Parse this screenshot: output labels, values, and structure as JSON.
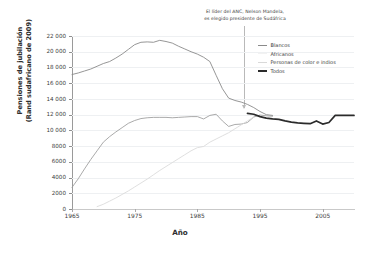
{
  "chart_data": {
    "type": "line",
    "title": "",
    "annotation": {
      "line1": "El líder del ANC, Nelson Mandela,",
      "line2": "es elegido presidente de Sudáfrica",
      "year": 1994
    },
    "xlabel": "Año",
    "ylabel_line1": "Pensiones de jubilación",
    "ylabel_line2": "(Rand sudafricano de 2009)",
    "xlim": [
      1965,
      2010
    ],
    "ylim": [
      0,
      22000
    ],
    "grid": true,
    "legend_position": "top-right",
    "xticks": [
      1965,
      1975,
      1985,
      1995,
      2005
    ],
    "xtick_labels": [
      "1965",
      "1975",
      "1985",
      "1995",
      "2005"
    ],
    "yticks": [
      0,
      2000,
      4000,
      6000,
      8000,
      10000,
      12000,
      14000,
      16000,
      18000,
      20000,
      22000
    ],
    "ytick_labels": [
      "0",
      "2000",
      "4000",
      "6000",
      "8000",
      "10 000",
      "12 000",
      "14 000",
      "16 000",
      "18 000",
      "20 000",
      "22 000"
    ],
    "series": [
      {
        "name": "Blancos",
        "color": "#8a8a8a",
        "width": 0.9,
        "x": [
          1965,
          1966,
          1967,
          1968,
          1969,
          1970,
          1971,
          1972,
          1973,
          1974,
          1975,
          1976,
          1977,
          1978,
          1979,
          1980,
          1981,
          1982,
          1983,
          1984,
          1985,
          1986,
          1987,
          1988,
          1989,
          1990,
          1991,
          1992,
          1993,
          1994,
          1995,
          1996,
          1997
        ],
        "values": [
          17100,
          17300,
          17550,
          17800,
          18150,
          18500,
          18750,
          19200,
          19700,
          20300,
          20900,
          21200,
          21250,
          21200,
          21450,
          21300,
          21100,
          20700,
          20350,
          20000,
          19700,
          19300,
          18750,
          17000,
          15300,
          14100,
          13800,
          13600,
          13300,
          12900,
          12400,
          12000,
          11900
        ]
      },
      {
        "name": "Africanos",
        "color": "#9b9b9b",
        "width": 0.85,
        "x": [
          1965,
          1966,
          1967,
          1968,
          1969,
          1970,
          1971,
          1972,
          1973,
          1974,
          1975,
          1976,
          1977,
          1978,
          1979,
          1980,
          1981,
          1982,
          1983,
          1984,
          1985,
          1986,
          1987,
          1988,
          1989,
          1990,
          1991,
          1992,
          1993,
          1994,
          1995,
          1996,
          1997
        ],
        "values": [
          2750,
          3850,
          5100,
          6300,
          7400,
          8500,
          9200,
          9800,
          10350,
          10900,
          11250,
          11500,
          11600,
          11650,
          11650,
          11650,
          11600,
          11650,
          11700,
          11750,
          11750,
          11450,
          11900,
          12050,
          11200,
          10500,
          10750,
          10800,
          11000,
          11700,
          11950,
          11850,
          11800
        ]
      },
      {
        "name": "Personas de color e indios",
        "color": "#d9d9d9",
        "width": 0.85,
        "x": [
          1969,
          1970,
          1971,
          1972,
          1973,
          1974,
          1975,
          1976,
          1977,
          1978,
          1979,
          1980,
          1981,
          1982,
          1983,
          1984,
          1985,
          1986,
          1987,
          1988,
          1989,
          1990,
          1991,
          1992,
          1993,
          1994
        ],
        "values": [
          300,
          600,
          1000,
          1400,
          1850,
          2300,
          2800,
          3300,
          3800,
          4350,
          4900,
          5400,
          5900,
          6400,
          6900,
          7400,
          7800,
          7950,
          8500,
          8900,
          9300,
          9700,
          10200,
          10700,
          11200,
          11700
        ]
      },
      {
        "name": "Todos",
        "color": "#2b2b2b",
        "width": 1.7,
        "x": [
          1993,
          1994,
          1995,
          1996,
          1997,
          1998,
          1999,
          2000,
          2001,
          2002,
          2003,
          2004,
          2005,
          2006,
          2007,
          2008,
          2009,
          2010
        ],
        "values": [
          12150,
          12050,
          11750,
          11550,
          11450,
          11400,
          11200,
          11050,
          10950,
          10900,
          10850,
          11200,
          10800,
          11000,
          11900,
          11900,
          11900,
          11900
        ]
      }
    ]
  },
  "legend": {
    "items": [
      {
        "label": "Blancos"
      },
      {
        "label": "Africanos"
      },
      {
        "label": "Personas de color e indios"
      },
      {
        "label": "Todos"
      }
    ]
  }
}
